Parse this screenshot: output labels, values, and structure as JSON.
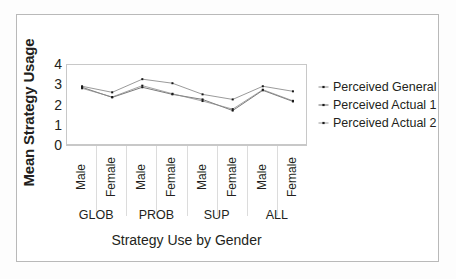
{
  "chart_data": {
    "type": "line",
    "title": "",
    "xlabel": "Strategy Use by Gender",
    "ylabel": "Mean Strategy Usage",
    "ylim": [
      0,
      4
    ],
    "yticks": [
      4,
      3,
      2,
      1,
      0
    ],
    "grid": true,
    "legend_position": "right",
    "categories": [
      "Male",
      "Female",
      "Male",
      "Female",
      "Male",
      "Female",
      "Male",
      "Female"
    ],
    "groups": [
      {
        "label": "GLOB",
        "categories": [
          "Male",
          "Female"
        ]
      },
      {
        "label": "PROB",
        "categories": [
          "Male",
          "Female"
        ]
      },
      {
        "label": "SUP",
        "categories": [
          "Male",
          "Female"
        ]
      },
      {
        "label": "ALL",
        "categories": [
          "Male",
          "Female"
        ]
      }
    ],
    "series": [
      {
        "name": "Perceived General",
        "values": [
          2.95,
          2.65,
          3.3,
          3.1,
          2.55,
          2.3,
          2.95,
          2.7
        ]
      },
      {
        "name": "Perceived Actual 1",
        "values": [
          2.9,
          2.4,
          2.9,
          2.55,
          2.3,
          1.75,
          2.75,
          2.2
        ]
      },
      {
        "name": "Perceived Actual 2",
        "values": [
          2.85,
          2.42,
          2.98,
          2.58,
          2.22,
          1.82,
          2.78,
          2.23
        ]
      }
    ]
  },
  "axes": {
    "y_title": "Mean Strategy Usage",
    "x_title": "Strategy Use by Gender",
    "y_tick_labels": [
      "4",
      "3",
      "2",
      "1",
      "0"
    ],
    "x_tick_labels": [
      "Male",
      "Female",
      "Male",
      "Female",
      "Male",
      "Female",
      "Male",
      "Female"
    ],
    "group_labels": [
      "GLOB",
      "PROB",
      "SUP",
      "ALL"
    ]
  },
  "legend": {
    "items": [
      {
        "label": "Perceived General"
      },
      {
        "label": "Perceived Actual 1"
      },
      {
        "label": "Perceived Actual 2"
      }
    ]
  },
  "colors": {
    "series_general": "#808080",
    "series_actual1": "#595959",
    "series_actual2": "#8c8c8c",
    "marker": "#1a1a1a",
    "axis": "#c8c8c8",
    "grid": "#dcdcdc",
    "text": "#231f20",
    "border": "#b9b9b9",
    "background": "#ffffff"
  }
}
